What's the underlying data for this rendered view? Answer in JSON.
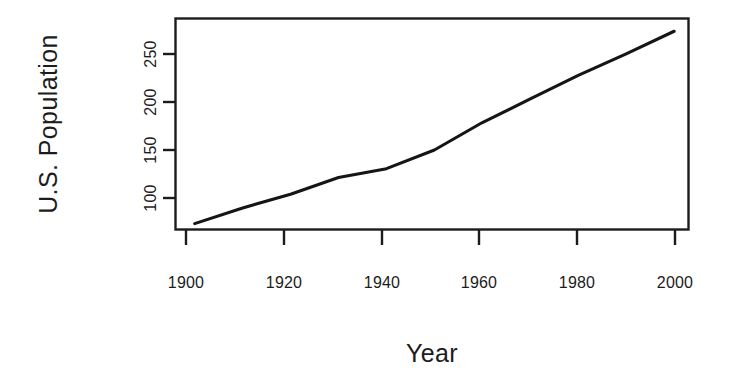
{
  "figure": {
    "background_color": "#ffffff",
    "line_color": "#151515",
    "axis_color": "#1c1c1c",
    "width": 734,
    "height": 390
  },
  "axis": {
    "y_title": "U.S. Population",
    "x_title": "Year",
    "x_tick_labels": [
      "1900",
      "1920",
      "1940",
      "1960",
      "1980",
      "2000"
    ],
    "y_tick_labels": [
      "100",
      "150",
      "200",
      "250"
    ]
  },
  "chart_data": {
    "type": "line",
    "title": "",
    "subtitle": "",
    "xlabel": "Year",
    "ylabel": "U.S. Population",
    "xlim": [
      1896,
      2003
    ],
    "ylim": [
      70,
      285
    ],
    "xticks": [
      1900,
      1920,
      1940,
      1960,
      1980,
      2000
    ],
    "yticks": [
      100,
      150,
      200,
      250
    ],
    "grid": false,
    "legend": false,
    "legend_position": "none",
    "units": "millions of people",
    "series": [
      {
        "name": "U.S. Population",
        "color": "#151515",
        "x": [
          1900,
          1910,
          1920,
          1930,
          1940,
          1950,
          1960,
          1970,
          1980,
          1990,
          2000
        ],
        "values": [
          76,
          92,
          106,
          123,
          132,
          151,
          179,
          203,
          227,
          249,
          272
        ]
      }
    ],
    "annotations": []
  }
}
